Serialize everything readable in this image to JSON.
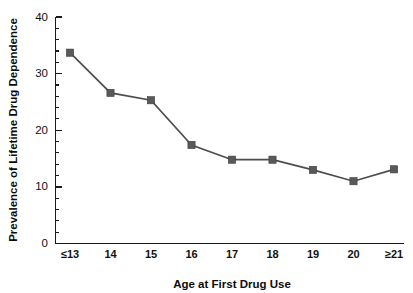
{
  "chart_data": {
    "type": "line",
    "title": "",
    "xlabel": "Age at First Drug Use",
    "ylabel": "Prevalence of Lifetime Drug Dependence",
    "categories": [
      "≤13",
      "14",
      "15",
      "16",
      "17",
      "18",
      "19",
      "20",
      "≥21"
    ],
    "values": [
      33.7,
      26.6,
      25.3,
      17.4,
      14.8,
      14.8,
      13.0,
      11.0,
      13.1
    ],
    "series": [
      {
        "name": "Prevalence of Lifetime Drug Dependence",
        "values": [
          33.7,
          26.6,
          25.3,
          17.4,
          14.8,
          14.8,
          13.0,
          11.0,
          13.1
        ]
      }
    ],
    "ylim": [
      0,
      40
    ],
    "ytick_labels": [
      "0",
      "10",
      "20",
      "30",
      "40"
    ],
    "ytick_values": [
      0,
      10,
      20,
      30,
      40
    ],
    "yminor_step": 2,
    "grid": false,
    "legend": "none",
    "marker": "square",
    "marker_color": "#595959",
    "line_color": "#4d4d4d",
    "axis_color": "#1a1a1a",
    "background_color": "#ffffff"
  },
  "axes": {
    "y_title": "Prevalence of Lifetime Drug Dependence",
    "x_title": "Age at First Drug Use"
  }
}
